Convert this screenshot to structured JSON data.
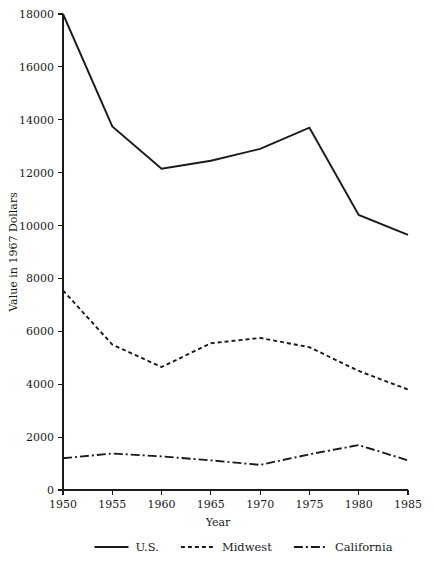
{
  "chart_data": {
    "type": "line",
    "title": "",
    "xlabel": "Year",
    "ylabel": "Value in 1967 Dollars",
    "x": [
      1950,
      1955,
      1960,
      1965,
      1970,
      1975,
      1980,
      1985
    ],
    "xticklabels": [
      "1950",
      "1955",
      "1960",
      "1965",
      "1970",
      "1975",
      "1980",
      "1985"
    ],
    "yticks": [
      0,
      2000,
      4000,
      6000,
      8000,
      10000,
      12000,
      14000,
      16000,
      18000
    ],
    "yticklabels": [
      "0",
      "2000",
      "4000",
      "6000",
      "8000",
      "10000",
      "12000",
      "14000",
      "16000",
      "18000"
    ],
    "xlim": [
      1950,
      1985
    ],
    "ylim": [
      0,
      18000
    ],
    "grid": false,
    "legend_position": "below",
    "series": [
      {
        "name": "U.S.",
        "style": "solid",
        "dash": "none",
        "color": "#1a1a1a",
        "values": [
          18000,
          13750,
          12150,
          12450,
          12900,
          13700,
          10400,
          9650
        ]
      },
      {
        "name": "Midwest",
        "style": "dotted",
        "dash": "4,3",
        "color": "#1a1a1a",
        "values": [
          7550,
          5500,
          4650,
          5550,
          5750,
          5400,
          4500,
          3800
        ]
      },
      {
        "name": "California",
        "style": "dash-dot",
        "dash": "9,3,2,3",
        "color": "#1a1a1a",
        "values": [
          1200,
          1380,
          1270,
          1120,
          950,
          1350,
          1700,
          1120
        ]
      }
    ]
  },
  "legend": {
    "entries": [
      {
        "label": "U.S."
      },
      {
        "label": "Midwest"
      },
      {
        "label": "California"
      }
    ]
  },
  "axes": {
    "x_title": "Year",
    "y_title": "Value in 1967 Dollars"
  }
}
